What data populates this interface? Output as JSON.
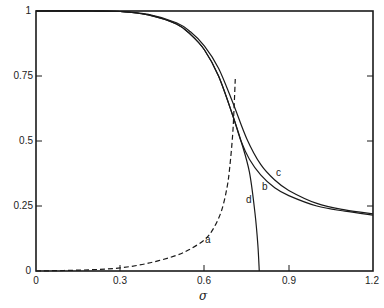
{
  "chart_data": {
    "type": "line",
    "title": "",
    "xlabel": "σ",
    "ylabel": "",
    "xlim": [
      0,
      1.2
    ],
    "ylim": [
      0,
      1
    ],
    "grid": false,
    "legend": "none (curves labelled inline a, b, c, d)",
    "x_ticks": [
      "0",
      "0.3",
      "0.6",
      "0.9",
      "1.2"
    ],
    "y_ticks": [
      "0",
      "0.25",
      "0.5",
      "0.75",
      "1"
    ],
    "series": [
      {
        "name": "a",
        "style": "dashed",
        "x": [
          0,
          0.1,
          0.2,
          0.3,
          0.4,
          0.5,
          0.55,
          0.6,
          0.63,
          0.66,
          0.68,
          0.69,
          0.7,
          0.705,
          0.71
        ],
        "y": [
          0,
          0.002,
          0.005,
          0.012,
          0.03,
          0.06,
          0.085,
          0.12,
          0.16,
          0.23,
          0.32,
          0.4,
          0.52,
          0.62,
          0.75
        ]
      },
      {
        "name": "b",
        "style": "solid",
        "x": [
          0,
          0.2,
          0.3,
          0.4,
          0.5,
          0.55,
          0.6,
          0.65,
          0.7,
          0.73,
          0.76,
          0.8,
          0.85,
          0.9,
          1.0,
          1.1,
          1.2
        ],
        "y": [
          1,
          1,
          0.998,
          0.985,
          0.95,
          0.91,
          0.85,
          0.75,
          0.6,
          0.5,
          0.43,
          0.37,
          0.32,
          0.29,
          0.25,
          0.23,
          0.215
        ]
      },
      {
        "name": "c",
        "style": "solid",
        "x": [
          0,
          0.2,
          0.3,
          0.4,
          0.5,
          0.55,
          0.6,
          0.65,
          0.7,
          0.75,
          0.8,
          0.85,
          0.9,
          1.0,
          1.1,
          1.2
        ],
        "y": [
          1,
          1,
          0.998,
          0.987,
          0.955,
          0.92,
          0.865,
          0.78,
          0.65,
          0.51,
          0.41,
          0.35,
          0.31,
          0.26,
          0.235,
          0.22
        ]
      },
      {
        "name": "d",
        "style": "solid",
        "x": [
          0,
          0.2,
          0.3,
          0.4,
          0.5,
          0.55,
          0.6,
          0.65,
          0.7,
          0.73,
          0.76,
          0.78,
          0.79,
          0.795
        ],
        "y": [
          1,
          1,
          0.998,
          0.985,
          0.95,
          0.91,
          0.85,
          0.75,
          0.6,
          0.5,
          0.38,
          0.22,
          0.1,
          0
        ]
      }
    ],
    "annotations": [
      {
        "text": "a",
        "x": 0.65,
        "y": 0.12
      },
      {
        "text": "b",
        "x": 0.85,
        "y": 0.38
      },
      {
        "text": "c",
        "x": 0.875,
        "y": 0.42
      },
      {
        "text": "d",
        "x": 0.765,
        "y": 0.3
      }
    ]
  },
  "axes": {
    "x_title": "σ",
    "x_tick_labels": [
      "0",
      "0.3",
      "0.6",
      "0.9",
      "1.2"
    ],
    "y_tick_labels": [
      "0",
      "0.25",
      "0.5",
      "0.75",
      "1"
    ]
  },
  "labels": {
    "a": "a",
    "b": "b",
    "c": "c",
    "d": "d"
  },
  "colors": {
    "line": "#1a1a1a",
    "axis": "#1a1a1a",
    "background": "#ffffff"
  }
}
